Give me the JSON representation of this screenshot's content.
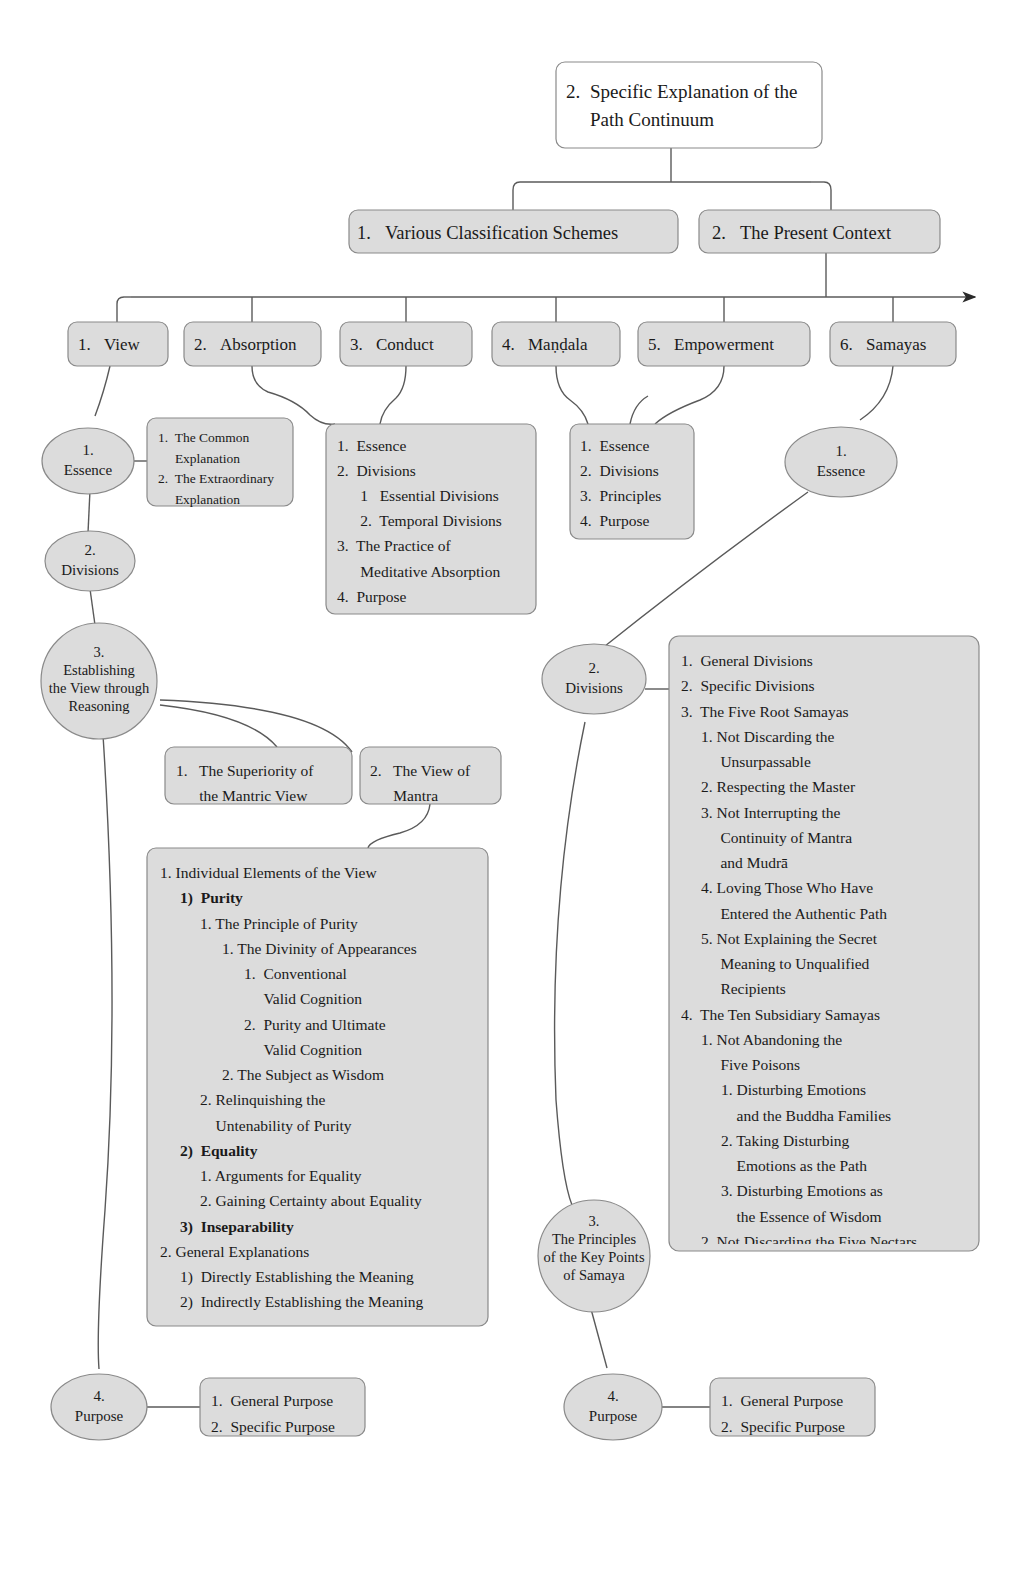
{
  "diagram": {
    "title_node": {
      "num": "2.",
      "text": "Specific Explanation of the\nPath Continuum"
    },
    "level2": [
      {
        "num": "1.",
        "text": "Various Classification Schemes"
      },
      {
        "num": "2.",
        "text": "The Present Context"
      }
    ],
    "categories": [
      {
        "num": "1.",
        "text": "View"
      },
      {
        "num": "2.",
        "text": "Absorption"
      },
      {
        "num": "3.",
        "text": "Conduct"
      },
      {
        "num": "4.",
        "text": "Maṇḍala"
      },
      {
        "num": "5.",
        "text": "Empowerment"
      },
      {
        "num": "6.",
        "text": "Samayas"
      }
    ],
    "view_branch": {
      "essence": "1.\nEssence",
      "essence_box": "1.  The Common\n     Explanation\n2.  The Extraordinary\n     Explanation",
      "divisions": "2.\nDivisions",
      "reasoning": "3.\nEstablishing\nthe View through\nReasoning",
      "reasoning_child_1": "1.   The Superiority of\n      the Mantric View",
      "reasoning_child_2": "2.   The View of\n      Mantra",
      "view_detail": [
        {
          "indent": 0,
          "text": "1. Individual Elements of the View",
          "bold": false
        },
        {
          "indent": 1,
          "text": "1)  Purity",
          "bold": true
        },
        {
          "indent": 2,
          "text": "1. The Principle of Purity",
          "bold": false
        },
        {
          "indent": 3,
          "text": "1. The Divinity of Appearances",
          "bold": false
        },
        {
          "indent": 4,
          "text": "1.  Conventional",
          "bold": false
        },
        {
          "indent": 4,
          "text": "     Valid Cognition",
          "bold": false
        },
        {
          "indent": 4,
          "text": "2.  Purity and Ultimate",
          "bold": false
        },
        {
          "indent": 4,
          "text": "     Valid Cognition",
          "bold": false
        },
        {
          "indent": 3,
          "text": "2. The Subject as Wisdom",
          "bold": false
        },
        {
          "indent": 2,
          "text": "2. Relinquishing the",
          "bold": false
        },
        {
          "indent": 2,
          "text": "    Untenability of Purity",
          "bold": false
        },
        {
          "indent": 1,
          "text": "2)  Equality",
          "bold": true
        },
        {
          "indent": 2,
          "text": "1. Arguments for Equality",
          "bold": false
        },
        {
          "indent": 2,
          "text": "2. Gaining Certainty about Equality",
          "bold": false
        },
        {
          "indent": 1,
          "text": "3)  Inseparability",
          "bold": true
        },
        {
          "indent": 0,
          "text": "2. General Explanations",
          "bold": false
        },
        {
          "indent": 1,
          "text": "1)  Directly Establishing the Meaning",
          "bold": false
        },
        {
          "indent": 1,
          "text": "2)  Indirectly Establishing the Meaning",
          "bold": false
        }
      ],
      "purpose": "4.\nPurpose",
      "purpose_box": "1.  General Purpose\n2.  Specific Purpose"
    },
    "absorption_conduct_box": "1.  Essence\n2.  Divisions\n      1   Essential Divisions\n      2.  Temporal Divisions\n3.  The Practice of\n      Meditative Absorption\n4.  Purpose",
    "mandala_empowerment_box": "1.  Essence\n2.  Divisions\n3.  Principles\n4.  Purpose",
    "samaya_branch": {
      "essence": "1.\nEssence",
      "divisions": "2.\nDivisions",
      "divisions_detail": [
        {
          "indent": 0,
          "text": "1.  General Divisions"
        },
        {
          "indent": 0,
          "text": "2.  Specific Divisions"
        },
        {
          "indent": 0,
          "text": "3.  The Five Root Samayas"
        },
        {
          "indent": 1,
          "text": "1. Not Discarding the"
        },
        {
          "indent": 1,
          "text": "     Unsurpassable"
        },
        {
          "indent": 1,
          "text": "2. Respecting the Master"
        },
        {
          "indent": 1,
          "text": "3. Not Interrupting the"
        },
        {
          "indent": 1,
          "text": "     Continuity of Mantra"
        },
        {
          "indent": 1,
          "text": "     and Mudrā"
        },
        {
          "indent": 1,
          "text": "4. Loving Those Who Have"
        },
        {
          "indent": 1,
          "text": "     Entered the Authentic Path"
        },
        {
          "indent": 1,
          "text": "5. Not Explaining the Secret"
        },
        {
          "indent": 1,
          "text": "     Meaning to Unqualified"
        },
        {
          "indent": 1,
          "text": "     Recipients"
        },
        {
          "indent": 0,
          "text": "4.  The Ten Subsidiary Samayas"
        },
        {
          "indent": 1,
          "text": "1. Not Abandoning the"
        },
        {
          "indent": 1,
          "text": "     Five Poisons"
        },
        {
          "indent": 2,
          "text": "1. Disturbing Emotions"
        },
        {
          "indent": 2,
          "text": "    and the Buddha Families"
        },
        {
          "indent": 2,
          "text": "2. Taking Disturbing"
        },
        {
          "indent": 2,
          "text": "    Emotions as the Path"
        },
        {
          "indent": 2,
          "text": "3. Disturbing Emotions as"
        },
        {
          "indent": 2,
          "text": "    the Essence of Wisdom"
        },
        {
          "indent": 1,
          "text": "2. Not Discarding the Five Nectars"
        }
      ],
      "principles": "3.\nThe Principles\nof the Key Points\nof Samaya",
      "purpose": "4.\nPurpose",
      "purpose_box": "1.  General Purpose\n2.  Specific Purpose"
    },
    "colors": {
      "node_fill": "#dcdcdc",
      "node_stroke": "#8a8a8a",
      "root_fill": "#ffffff",
      "edge": "#5a5a5a",
      "text": "#1a1a1a",
      "background": "#ffffff"
    }
  }
}
